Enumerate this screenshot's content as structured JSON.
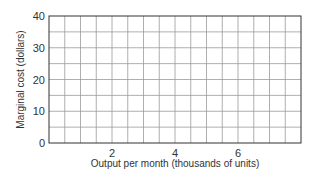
{
  "chart_data": {
    "type": "line",
    "title": "",
    "xlabel": "Output per month (thousands of units)",
    "ylabel": "Marginal cost (dollars)",
    "xlim": [
      0,
      8
    ],
    "ylim": [
      0,
      40
    ],
    "x_ticks": [
      2,
      4,
      6
    ],
    "x_tick_labels": [
      "2",
      "4",
      "6"
    ],
    "y_ticks": [
      0,
      10,
      20,
      30,
      40
    ],
    "y_tick_labels": [
      "0",
      "10",
      "20",
      "30",
      "40"
    ],
    "grid": true,
    "x_grid_step": 0.5,
    "y_grid_step": 5,
    "series": [],
    "legend": null
  },
  "colors": {
    "axis": "#333333",
    "grid": "#9a9a9a",
    "text": "#333333",
    "background": "#ffffff"
  }
}
